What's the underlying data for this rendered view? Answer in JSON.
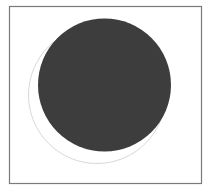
{
  "diagram": {
    "title": "",
    "frame": {
      "x": 9.5,
      "y": 6.5,
      "width": 192,
      "height": 177,
      "stroke": "#7a7a7a",
      "stroke_width": 1.2
    },
    "shapes": [
      {
        "id": "outline-circle",
        "type": "circle",
        "cx": 97,
        "cy": 95,
        "r": 68.5,
        "fill": "none",
        "stroke": "#d8d8d8",
        "stroke_width": 1
      },
      {
        "id": "filled-circle",
        "type": "circle",
        "cx": 104.5,
        "cy": 85,
        "r": 66.5,
        "fill": "#3d3d3d",
        "stroke": "none"
      }
    ]
  }
}
